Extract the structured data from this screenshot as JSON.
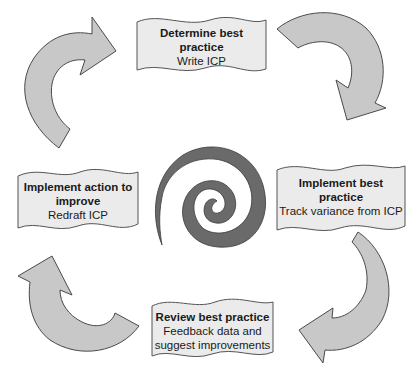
{
  "diagram": {
    "type": "cycle",
    "colors": {
      "arrow_fill": "#c8c8c8",
      "arrow_stroke": "#4a4a4a",
      "box_fill": "#ebebeb",
      "box_stroke": "#555555",
      "spiral_fill": "#6a6a6a"
    },
    "steps": [
      {
        "title": "Determine best practice",
        "title_lines": [
          "Determine best",
          "practice"
        ],
        "subtitle_lines": [
          "Write ICP"
        ]
      },
      {
        "title": "Implement best practice",
        "title_lines": [
          "Implement best",
          "practice"
        ],
        "subtitle_lines": [
          "Track variance from ICP"
        ]
      },
      {
        "title": "Review best practice",
        "title_lines": [
          "Review best practice"
        ],
        "subtitle_lines": [
          "Feedback data and",
          "suggest improvements"
        ]
      },
      {
        "title": "Implement action to improve",
        "title_lines": [
          "Implement action to",
          "improve"
        ],
        "subtitle_lines": [
          "Redraft ICP"
        ]
      }
    ],
    "arrows": [
      "top-right-clockwise",
      "bottom-right-clockwise",
      "bottom-left-clockwise",
      "top-left-clockwise"
    ],
    "center_icon": "spiral"
  }
}
